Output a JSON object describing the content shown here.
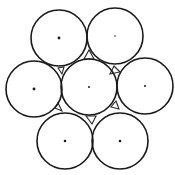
{
  "diagram": {
    "title": "",
    "width": 175,
    "height": 175,
    "stroke_color": "#1a1a1a",
    "background": "#ffffff",
    "radius": 28,
    "circles": [
      {
        "id": "top-left",
        "cx": 59,
        "cy": 38,
        "dot_r": 1.4
      },
      {
        "id": "top-right",
        "cx": 115,
        "cy": 36,
        "dot_r": 0.8
      },
      {
        "id": "middle-left",
        "cx": 34,
        "cy": 89,
        "dot_r": 1.4
      },
      {
        "id": "center",
        "cx": 89,
        "cy": 87,
        "dot_r": 1.0
      },
      {
        "id": "middle-right",
        "cx": 145,
        "cy": 86,
        "dot_r": 1.0
      },
      {
        "id": "bottom-left",
        "cx": 65,
        "cy": 141,
        "dot_r": 1.3
      },
      {
        "id": "bottom-right",
        "cx": 120,
        "cy": 141,
        "dot_r": 1.3
      }
    ],
    "gap_triangles": [
      [
        [
          84,
          59
        ],
        [
          94,
          59
        ],
        [
          89,
          50
        ]
      ],
      [
        [
          114,
          66
        ],
        [
          120,
          72
        ],
        [
          110,
          74
        ]
      ],
      [
        [
          116,
          101
        ],
        [
          119,
          109
        ],
        [
          111,
          107
        ]
      ],
      [
        [
          86,
          116
        ],
        [
          96,
          116
        ],
        [
          92,
          124
        ]
      ],
      [
        [
          58,
          103
        ],
        [
          62,
          111
        ],
        [
          55,
          108
        ]
      ],
      [
        [
          58,
          68
        ],
        [
          64,
          67
        ],
        [
          62,
          74
        ]
      ]
    ]
  }
}
